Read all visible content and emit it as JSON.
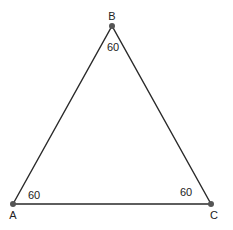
{
  "diagram": {
    "type": "equilateral-triangle",
    "colors": {
      "stroke": "#2a2a2a",
      "vertex": "#555555",
      "text": "#222222",
      "background": "#ffffff"
    },
    "vertices": [
      {
        "name": "A",
        "x": 13,
        "y": 204,
        "angle": "60"
      },
      {
        "name": "B",
        "x": 112,
        "y": 26,
        "angle": "60"
      },
      {
        "name": "C",
        "x": 211,
        "y": 204,
        "angle": "60"
      }
    ]
  },
  "labels": {
    "A": "A",
    "B": "B",
    "C": "C",
    "angle_A": "60",
    "angle_B": "60",
    "angle_C": "60"
  }
}
